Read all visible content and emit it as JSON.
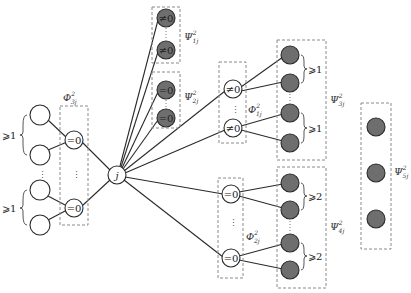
{
  "center_node": {
    "label": "j"
  },
  "left_group": {
    "constraint_labels": [
      "⩾1",
      "⩾1"
    ],
    "box_label": {
      "base": "Φ",
      "sup": "2",
      "sub": "3j"
    },
    "node_labels": [
      "=0",
      "=0"
    ]
  },
  "psi1": {
    "label": {
      "base": "Ψ",
      "sup": "2",
      "sub": "1j"
    },
    "node_labels": [
      "≠0",
      "≠0"
    ]
  },
  "psi2": {
    "label": {
      "base": "Ψ",
      "sup": "2",
      "sub": "2j"
    },
    "node_labels": [
      "=0",
      "=0"
    ]
  },
  "phi1": {
    "label": {
      "base": "Φ",
      "sup": "2",
      "sub": "1j"
    },
    "node_labels": [
      "≠0",
      "≠0"
    ]
  },
  "psi3": {
    "label": {
      "base": "Ψ",
      "sup": "2",
      "sub": "3j"
    },
    "constraint_labels": [
      "⩾1",
      "⩾1"
    ]
  },
  "phi2": {
    "label": {
      "base": "Φ",
      "sup": "2",
      "sub": "2j"
    },
    "node_labels": [
      "=0",
      "=0"
    ]
  },
  "psi4": {
    "label": {
      "base": "Ψ",
      "sup": "2",
      "sub": "4j"
    },
    "constraint_labels": [
      "⩾2",
      "⩾2"
    ]
  },
  "psi5": {
    "label": {
      "base": "Ψ",
      "sup": "2",
      "sub": "5j"
    }
  },
  "colors": {
    "filled_node": "#6e6e6e",
    "edge": "#2a2a2a",
    "dashed_box": "#8a8a8a"
  }
}
